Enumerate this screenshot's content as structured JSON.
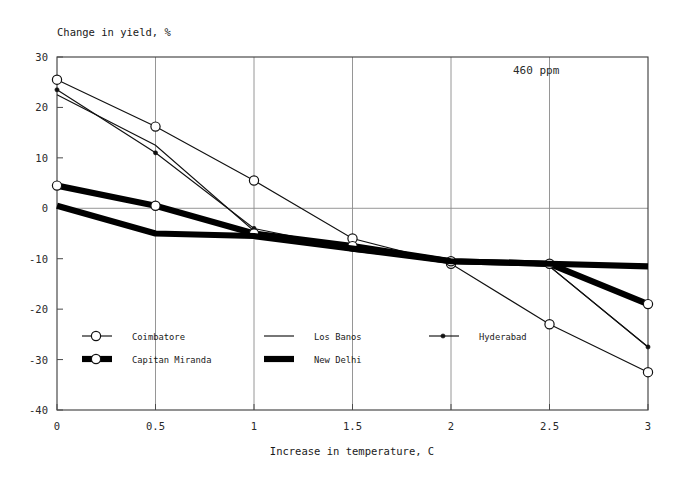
{
  "chart_data": {
    "type": "line",
    "title": "",
    "ylabel": "Change in yield, %",
    "xlabel": "Increase in temperature, C",
    "annotation": "460  ppm",
    "xlim": [
      0,
      3
    ],
    "ylim": [
      -40,
      30
    ],
    "grid": true,
    "legend_position": "inside-bottom",
    "x_ticks": [
      "0",
      "0.5",
      "1",
      "1.5",
      "2",
      "2.5",
      "3"
    ],
    "x_tick_values": [
      0,
      0.5,
      1,
      1.5,
      2,
      2.5,
      3
    ],
    "y_ticks": [
      "30",
      "20",
      "10",
      "0",
      "-10",
      "-20",
      "-30",
      "-40"
    ],
    "y_tick_values": [
      30,
      20,
      10,
      0,
      -10,
      -20,
      -30,
      -40
    ],
    "x": [
      0,
      0.5,
      1,
      1.5,
      2,
      2.5,
      3
    ],
    "series": [
      {
        "name": "Coimbatore",
        "marker": "open-circle",
        "style": "thin",
        "values": [
          25.5,
          16.2,
          5.5,
          -6.0,
          -11.0,
          -23.0,
          -32.5
        ]
      },
      {
        "name": "Los Banos",
        "marker": "none",
        "style": "thin",
        "values": [
          22.5,
          12.5,
          -4.5,
          -8.5,
          -10.5,
          -11.5,
          -27.5
        ]
      },
      {
        "name": "Hyderabad",
        "marker": "dot",
        "style": "thin",
        "values": [
          23.5,
          11.0,
          -4.0,
          -8.0,
          -10.5,
          -11.5,
          -27.5
        ]
      },
      {
        "name": "Capitan Miranda",
        "marker": "open-circle",
        "style": "thick",
        "values": [
          4.5,
          0.5,
          -5.0,
          -7.5,
          -10.5,
          -11.0,
          -19.0
        ]
      },
      {
        "name": "New Delhi",
        "marker": "none",
        "style": "thick",
        "values": [
          0.5,
          -5.0,
          -5.5,
          -8.0,
          -10.5,
          -11.0,
          -11.5
        ]
      }
    ],
    "legend": [
      {
        "label": "Coimbatore",
        "marker": "open-circle",
        "style": "thin",
        "col": 0,
        "row": 0
      },
      {
        "label": "Capitan Miranda",
        "marker": "open-circle",
        "style": "thick",
        "col": 0,
        "row": 1
      },
      {
        "label": "Los Banos",
        "marker": "none",
        "style": "thin",
        "col": 1,
        "row": 0
      },
      {
        "label": "New Delhi",
        "marker": "none",
        "style": "thick",
        "col": 1,
        "row": 1
      },
      {
        "label": "Hyderabad",
        "marker": "dot",
        "style": "thin",
        "col": 2,
        "row": 0
      }
    ]
  }
}
